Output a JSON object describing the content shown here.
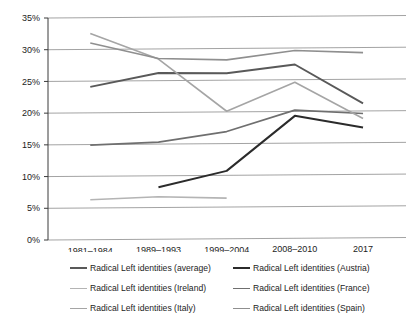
{
  "chart_data": {
    "type": "line",
    "title": "",
    "subtitle": "",
    "xlabel": "",
    "ylabel": "",
    "categories": [
      "1981–1984",
      "1989–1993",
      "1999–2004",
      "2008–2010",
      "2017"
    ],
    "ylim": [
      0,
      35
    ],
    "ytick_values": [
      0,
      5,
      10,
      15,
      20,
      25,
      30,
      35
    ],
    "ytick_labels": [
      "0%",
      "5%",
      "10%",
      "15%",
      "20%",
      "25%",
      "30%",
      "35%"
    ],
    "grid": "horizontal",
    "legend_position": "bottom",
    "legend_columns": 2,
    "series": [
      {
        "name": "Radical Left identities (average)",
        "color": "#595959",
        "width": 1.9,
        "values": [
          24.1,
          26.2,
          26.1,
          27.4,
          21.2
        ]
      },
      {
        "name": "Radical Left identities (Austria)",
        "color": "#2b2b2b",
        "width": 2.0,
        "values": [
          null,
          8.2,
          10.7,
          19.3,
          17.4
        ]
      },
      {
        "name": "Radical Left identities (Ireland)",
        "color": "#b4b4b4",
        "width": 1.6,
        "values": [
          6.3,
          6.7,
          6.4,
          null,
          10.3
        ]
      },
      {
        "name": "Radical Left identities (France)",
        "color": "#6f6f6f",
        "width": 1.7,
        "values": [
          14.9,
          15.3,
          16.9,
          20.2,
          19.6
        ]
      },
      {
        "name": "Radical Left identities (Italy)",
        "color": "#a5a5a5",
        "width": 1.6,
        "values": [
          32.5,
          28.4,
          20.1,
          24.6,
          18.8
        ]
      },
      {
        "name": "Radical Left identities (Spain)",
        "color": "#8f8f8f",
        "width": 1.6,
        "values": [
          31.0,
          28.5,
          28.2,
          29.6,
          29.2
        ]
      }
    ]
  },
  "legend": {
    "items": [
      {
        "label": "Radical Left identities (average)",
        "color": "#595959",
        "width": 2.2
      },
      {
        "label": "Radical Left identities (Austria)",
        "color": "#2b2b2b",
        "width": 2.4
      },
      {
        "label": "Radical Left identities (Ireland)",
        "color": "#b4b4b4",
        "width": 1.6
      },
      {
        "label": "Radical Left identities (France)",
        "color": "#6f6f6f",
        "width": 1.9
      },
      {
        "label": "Radical Left identities (Italy)",
        "color": "#a5a5a5",
        "width": 1.7
      },
      {
        "label": "Radical Left identities (Spain)",
        "color": "#8f8f8f",
        "width": 1.8
      }
    ]
  }
}
